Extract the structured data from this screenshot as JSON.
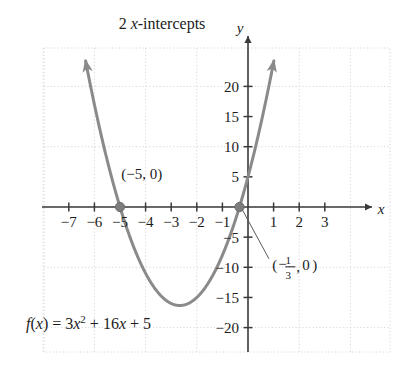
{
  "figure": {
    "title_prefix": "2 ",
    "title_var": "x",
    "title_suffix": "-intercepts",
    "x_axis_name": "x",
    "y_axis_name": "y",
    "curve_color": "#8a8a8a",
    "axis_color": "#3a3a3a",
    "grid_color": "#d6d6de",
    "point_color": "#7d7d7d",
    "text_color": "#1c1c1c"
  },
  "chart_data": {
    "type": "line",
    "title": "2 x-intercepts",
    "xlabel": "x",
    "ylabel": "y",
    "grid": true,
    "legend": "none",
    "function_label": "f(x) = 3x² + 16x + 5",
    "equation_parts": {
      "fx_f": "f",
      "fx_open": "(",
      "fx_var": "x",
      "fx_close": ")",
      "equals": " = ",
      "coef_a": "3",
      "var_x": "x",
      "exponent": "2",
      "plus_1": " + ",
      "coef_b": "16",
      "var_x2": "x",
      "plus_2": " + ",
      "const_c": "5"
    },
    "coefficients": {
      "a": 3,
      "b": 16,
      "c": 5
    },
    "xlim": [
      -7.8,
      3.9
    ],
    "ylim": [
      -22.5,
      24.5
    ],
    "xticks": [
      -7,
      -6,
      -5,
      -4,
      -3,
      -2,
      -1,
      1,
      2,
      3
    ],
    "xtick_labels": [
      "−7",
      "−6",
      "−5",
      "−4",
      "−3",
      "−2",
      "−1",
      "1",
      "2",
      "3"
    ],
    "yticks": [
      -20,
      -15,
      -10,
      -5,
      5,
      10,
      15,
      20
    ],
    "ytick_labels": [
      "−20",
      "−15",
      "−10",
      "−5",
      "5",
      "10",
      "15",
      "20"
    ],
    "grid_step_x": 2,
    "grid_step_y": 10,
    "vertex": {
      "x": -2.667,
      "y": -16.333
    },
    "roots": [
      {
        "x": -5,
        "y": 0,
        "label": "(−5, 0)"
      },
      {
        "x": -0.3333,
        "y": 0,
        "label": "(−1/3, 0)"
      }
    ],
    "annotations": [
      {
        "name": "root-left-label",
        "text": "(−5, 0)",
        "parts": {
          "open": "(",
          "neg": "−5",
          "comma": ", ",
          "zero": "0",
          "close": ")"
        },
        "at_x": -4.15,
        "at_y": 4.6
      },
      {
        "name": "root-right-label",
        "text": "(−1/3, 0)",
        "parts": {
          "open": "(",
          "minus": "−",
          "numer": "1",
          "denom": "3",
          "comma": ",",
          "zero": "0",
          "close": ")"
        },
        "at_x": 0.95,
        "at_y": -10.5,
        "leader_from": {
          "x": -0.3333,
          "y": 0
        },
        "leader_to": {
          "x": 0.82,
          "y": -8.6
        }
      }
    ],
    "arrowheads": [
      {
        "name": "curve-arrow-left",
        "x": -6.55,
        "y": 24.0
      },
      {
        "name": "curve-arrow-right",
        "x": 1.05,
        "y": 24.0
      }
    ]
  }
}
